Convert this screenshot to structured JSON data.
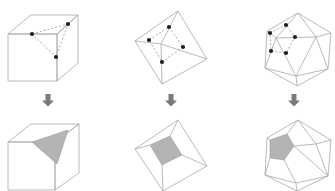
{
  "diagram": {
    "colors": {
      "background": "#ffffff",
      "edge": "#a8a8a8",
      "dashed_edge": "#9a9a9a",
      "vertex_dot": "#1e1e1e",
      "shaded_face": "#b4b4b4",
      "arrow": "#7a7a7a"
    },
    "columns": [
      {
        "name": "cube",
        "top": {
          "shape": "cube",
          "marked_vertices": 3,
          "connection": "dashed triangle"
        },
        "arrow": "down-arrow",
        "bottom": {
          "shape": "cube",
          "shaded_face": "triangle"
        }
      },
      {
        "name": "octahedron",
        "top": {
          "shape": "octahedron",
          "marked_vertices": 4,
          "connection": "dashed square"
        },
        "arrow": "down-arrow",
        "bottom": {
          "shape": "octahedron",
          "shaded_face": "square"
        }
      },
      {
        "name": "icosahedron",
        "top": {
          "shape": "icosahedron",
          "marked_vertices": 5,
          "connection": "dashed pentagon"
        },
        "arrow": "down-arrow",
        "bottom": {
          "shape": "icosahedron",
          "shaded_face": "pentagon"
        }
      }
    ]
  }
}
